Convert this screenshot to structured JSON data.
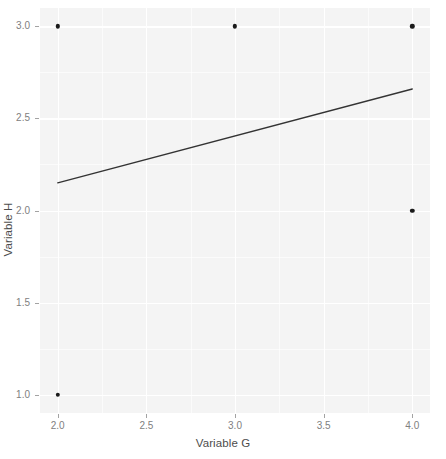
{
  "chart_data": {
    "type": "scatter",
    "title": "",
    "xlabel": "Variable G",
    "ylabel": "Variable H",
    "xlim": [
      1.9,
      4.1
    ],
    "ylim": [
      0.9,
      3.1
    ],
    "xticks": [
      "2.0",
      "2.5",
      "3.0",
      "3.5",
      "4.0"
    ],
    "xtick_values": [
      2.0,
      2.5,
      3.0,
      3.5,
      4.0
    ],
    "yticks": [
      "1.0",
      "1.5",
      "2.0",
      "2.5",
      "3.0"
    ],
    "ytick_values": [
      1.0,
      1.5,
      2.0,
      2.5,
      3.0
    ],
    "x_minor_ticks": [
      2.25,
      2.75,
      3.25,
      3.75
    ],
    "y_minor_ticks": [
      1.25,
      1.75,
      2.25,
      2.75
    ],
    "grid": true,
    "legend": "none",
    "points": [
      {
        "x": 2.0,
        "y": 3.0
      },
      {
        "x": 3.0,
        "y": 3.0
      },
      {
        "x": 4.0,
        "y": 3.0
      },
      {
        "x": 4.0,
        "y": 2.0
      },
      {
        "x": 2.0,
        "y": 1.0
      }
    ],
    "series": [
      {
        "name": "observations",
        "x": [
          2.0,
          3.0,
          4.0,
          4.0,
          2.0
        ],
        "y": [
          3.0,
          3.0,
          3.0,
          2.0,
          1.0
        ],
        "marker": "filled-circle",
        "color": "#1a1a1a"
      },
      {
        "name": "fit-line",
        "type": "line",
        "x": [
          2.0,
          4.0
        ],
        "y": [
          2.15,
          2.66
        ],
        "color": "#333333",
        "slope": 0.255,
        "intercept": 1.64
      }
    ],
    "panel_background": "#f4f4f4",
    "gridline_color": "#ffffff",
    "point_color": "#1a1a1a",
    "line_color": "#333333",
    "axis_text_color": "#808080",
    "axis_title_color": "#4d4d4d"
  }
}
